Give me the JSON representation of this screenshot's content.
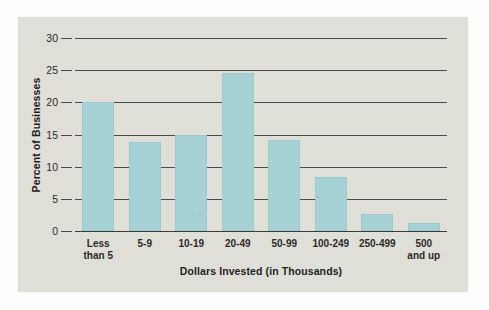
{
  "chart_data": {
    "type": "bar",
    "title": "",
    "xlabel": "Dollars Invested (in Thousands)",
    "ylabel": "Percent of Businesses",
    "categories": [
      "Less\nthan 5",
      "5-9",
      "10-19",
      "20-49",
      "50-99",
      "100-249",
      "250-499",
      "500\nand up"
    ],
    "values": [
      20.0,
      13.8,
      14.9,
      24.5,
      14.2,
      8.4,
      2.6,
      1.2
    ],
    "ylim": [
      0,
      30
    ],
    "yticks": [
      0,
      5,
      10,
      15,
      20,
      25,
      30
    ],
    "ytick_labels": [
      "0",
      "5",
      "10",
      "15",
      "20",
      "25",
      "30"
    ],
    "grid": true,
    "legend": "none",
    "bar_color": "#a6d2d6",
    "panel_color": "#e2e1da",
    "gridline_color": "#4c4c48"
  }
}
